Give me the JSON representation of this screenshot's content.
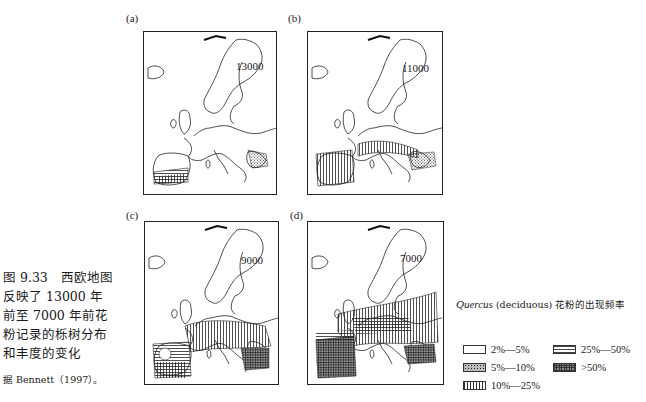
{
  "figure": {
    "panels": [
      {
        "label": "(a)",
        "year": "13000"
      },
      {
        "label": "(b)",
        "year": "11000"
      },
      {
        "label": "(c)",
        "year": "9000"
      },
      {
        "label": "(d)",
        "year": "7000"
      }
    ],
    "caption": "图 9.33　西欧地图反映了 13000 年前至 7000 年前花粉记录的栎树分布和丰度的变化",
    "source": "据 Bennett（1997）。"
  },
  "legend": {
    "title_italic": "Quercus",
    "title_rest": " (deciduous) 花粉的出现频率",
    "items": [
      {
        "label": "2%—5%",
        "pattern": "blank"
      },
      {
        "label": "5%—10%",
        "pattern": "stipple"
      },
      {
        "label": "10%—25%",
        "pattern": "vertical-lines"
      },
      {
        "label": "25%—50%",
        "pattern": "horizontal-lines"
      },
      {
        "label": ">50%",
        "pattern": "cross-hatch"
      }
    ]
  }
}
